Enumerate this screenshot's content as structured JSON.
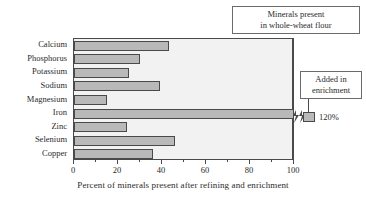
{
  "chart_data": {
    "type": "bar",
    "orientation": "horizontal",
    "title": "",
    "xlabel": "Percent of minerals present after refining and enrichment",
    "ylabel": "",
    "xlim": [
      0,
      100
    ],
    "xticks": [
      0,
      20,
      40,
      60,
      80,
      100
    ],
    "xtick_labels": [
      "0",
      "20",
      "40",
      "60",
      "80",
      "100"
    ],
    "grid": false,
    "categories": [
      "Calcium",
      "Phosphorus",
      "Potassium",
      "Sodium",
      "Magnesium",
      "Iron",
      "Zinc",
      "Selenium",
      "Copper"
    ],
    "values": [
      43,
      30,
      25,
      39,
      15,
      120,
      24,
      46,
      36
    ],
    "overflow_points": [
      {
        "category": "Iron",
        "value": 120,
        "label": "120%",
        "axis_break": true
      }
    ],
    "annotations": [
      {
        "name": "whole-wheat-flour",
        "lines": [
          "Minerals present",
          "in whole-wheat flour"
        ],
        "points_to": 100
      },
      {
        "name": "added-in-enrichment",
        "lines": [
          "Added in",
          "enrichment"
        ],
        "points_to": 120
      }
    ],
    "colors": {
      "bar_fill": "#b9b9b9",
      "bar_edge": "#4a4a4a",
      "plot_background": "#f2f2f2",
      "page_background": "#ffffff",
      "text": "#2b2b2b"
    }
  }
}
